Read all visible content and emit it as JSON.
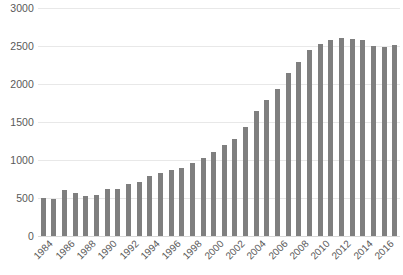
{
  "chart_data": {
    "type": "bar",
    "title": "",
    "xlabel": "",
    "ylabel": "",
    "ylim": [
      0,
      3000
    ],
    "ytick_values": [
      0,
      500,
      1000,
      1500,
      2000,
      2500,
      3000
    ],
    "ytick_labels": [
      "0",
      "500",
      "1000",
      "1500",
      "2000",
      "2500",
      "3000"
    ],
    "grid": true,
    "legend": "none",
    "bar_color": "#7f7f7f",
    "gridline_color": "#e8e8e8",
    "axis_text_color": "#595959",
    "background_color": "#ffffff",
    "xtick_labels": [
      "1984",
      "1986",
      "1988",
      "1990",
      "1992",
      "1994",
      "1996",
      "1998",
      "2000",
      "2002",
      "2004",
      "2006",
      "2008",
      "2010",
      "2012",
      "2014",
      "2016"
    ],
    "xtick_interval": 2,
    "categories": [
      "1984",
      "1985",
      "1986",
      "1987",
      "1988",
      "1989",
      "1990",
      "1991",
      "1992",
      "1993",
      "1994",
      "1995",
      "1996",
      "1997",
      "1998",
      "1999",
      "2000",
      "2001",
      "2002",
      "2003",
      "2004",
      "2005",
      "2006",
      "2007",
      "2008",
      "2009",
      "2010",
      "2011",
      "2012",
      "2013",
      "2014",
      "2015",
      "2016",
      "2017"
    ],
    "values": [
      500,
      490,
      600,
      560,
      520,
      545,
      620,
      615,
      690,
      705,
      790,
      830,
      870,
      900,
      960,
      1020,
      1100,
      1200,
      1280,
      1430,
      1650,
      1790,
      1930,
      2150,
      2290,
      2450,
      2530,
      2580,
      2600,
      2590,
      2580,
      2500,
      2490,
      2510
    ]
  }
}
